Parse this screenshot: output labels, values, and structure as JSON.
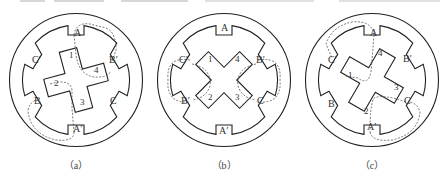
{
  "figure": {
    "panels": [
      {
        "id": "a",
        "caption": "（a）",
        "center": [
          76,
          80
        ],
        "rotor_angle": 0,
        "stator_labels": {
          "top": "A",
          "upper_right": "B′",
          "lower_right": "C",
          "bottom": "A′",
          "lower_left": "B",
          "upper_left": "C′"
        },
        "rotor_labels": [
          "1",
          "2",
          "3",
          "4"
        ],
        "flux_path": "A-A′ via rotor teeth 1 and 3"
      },
      {
        "id": "b",
        "caption": "（b）",
        "center": [
          224,
          80
        ],
        "rotor_angle": 45,
        "stator_labels": {
          "top": "A",
          "upper_right": "B′",
          "lower_right": "C",
          "bottom": "A′",
          "lower_left": "B",
          "upper_left": "C′"
        },
        "rotor_labels": [
          "1",
          "2",
          "3",
          "4"
        ],
        "flux_path": "B-B′ / C-C′ via rotor teeth"
      },
      {
        "id": "c",
        "caption": "（c）",
        "center": [
          372,
          80
        ],
        "rotor_angle": 30,
        "stator_labels": {
          "top": "A",
          "upper_right": "B′",
          "lower_right": "C",
          "bottom": "A′",
          "lower_left": "B",
          "upper_left": "C′"
        },
        "rotor_labels": [
          "1",
          "2",
          "3",
          "4"
        ],
        "flux_path": "C-C′ via rotor teeth 4 and 2"
      }
    ],
    "colors": {
      "line": "#222222",
      "dash": "#555555",
      "text": "#333333"
    }
  }
}
